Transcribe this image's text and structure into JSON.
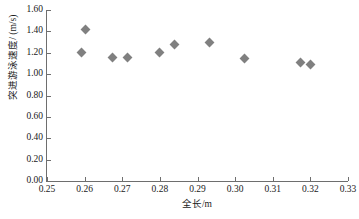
{
  "chart_data": {
    "type": "scatter",
    "title": "",
    "xlabel": "全长/m",
    "ylabel": "突进游泳速度/ (m/s)",
    "xlim": [
      0.25,
      0.33
    ],
    "ylim": [
      0.0,
      1.6
    ],
    "grid": false,
    "legend": null,
    "marker": {
      "shape": "diamond",
      "color": "#808080",
      "size": 7
    },
    "x_ticks": [
      "0.25",
      "0.26",
      "0.27",
      "0.28",
      "0.29",
      "0.30",
      "0.31",
      "0.32",
      "0.33"
    ],
    "x_tick_values": [
      0.25,
      0.26,
      0.27,
      0.28,
      0.29,
      0.3,
      0.31,
      0.32,
      0.33
    ],
    "y_ticks": [
      "0.00",
      "0.20",
      "0.40",
      "0.60",
      "0.80",
      "1.00",
      "1.20",
      "1.40",
      "1.60"
    ],
    "y_tick_values": [
      0.0,
      0.2,
      0.4,
      0.6,
      0.8,
      1.0,
      1.2,
      1.4,
      1.6
    ],
    "points": [
      {
        "x": 0.2603,
        "y": 1.42
      },
      {
        "x": 0.2592,
        "y": 1.2
      },
      {
        "x": 0.2675,
        "y": 1.16
      },
      {
        "x": 0.2715,
        "y": 1.16
      },
      {
        "x": 0.28,
        "y": 1.2
      },
      {
        "x": 0.284,
        "y": 1.28
      },
      {
        "x": 0.2932,
        "y": 1.3
      },
      {
        "x": 0.3025,
        "y": 1.15
      },
      {
        "x": 0.3175,
        "y": 1.11
      },
      {
        "x": 0.32,
        "y": 1.09
      }
    ],
    "x": [
      0.2603,
      0.2592,
      0.2675,
      0.2715,
      0.28,
      0.284,
      0.2932,
      0.3025,
      0.3175,
      0.32
    ],
    "values": [
      1.42,
      1.2,
      1.16,
      1.16,
      1.2,
      1.28,
      1.3,
      1.15,
      1.11,
      1.09
    ]
  }
}
